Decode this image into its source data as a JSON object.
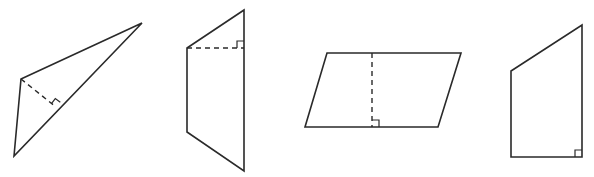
{
  "figure": {
    "colors": {
      "stroke": "#2a2a2a",
      "background": "#ffffff"
    },
    "shapes": [
      {
        "name": "obtuse-triangle",
        "type": "triangle",
        "vertices": [
          [
            21,
            79
          ],
          [
            142,
            23
          ],
          [
            14,
            156
          ]
        ],
        "height": {
          "from": [
            21,
            79
          ],
          "to": [
            56,
            107
          ],
          "style": "dashed"
        },
        "right_angle_marker": {
          "at": [
            56,
            107
          ]
        }
      },
      {
        "name": "trapezoid-vertical",
        "type": "trapezoid",
        "vertices": [
          [
            244,
            10
          ],
          [
            187,
            48
          ],
          [
            187,
            132
          ],
          [
            244,
            171
          ]
        ],
        "height": {
          "from": [
            187,
            48
          ],
          "to": [
            244,
            48
          ],
          "style": "dashed"
        },
        "right_angle_marker": {
          "at": [
            244,
            48
          ]
        }
      },
      {
        "name": "parallelogram",
        "type": "parallelogram",
        "vertices": [
          [
            327,
            53
          ],
          [
            461,
            53
          ],
          [
            438,
            127
          ],
          [
            305,
            127
          ]
        ],
        "height": {
          "from": [
            372,
            53
          ],
          "to": [
            372,
            127
          ],
          "style": "dashed"
        },
        "right_angle_marker": {
          "at": [
            372,
            127
          ]
        }
      },
      {
        "name": "right-trapezoid",
        "type": "right-trapezoid",
        "vertices": [
          [
            511,
            71
          ],
          [
            582,
            25
          ],
          [
            582,
            157
          ],
          [
            511,
            157
          ]
        ],
        "right_angle_marker": {
          "at": [
            582,
            157
          ]
        }
      }
    ]
  }
}
